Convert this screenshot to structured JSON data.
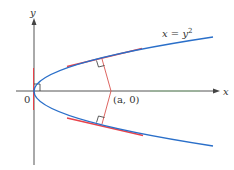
{
  "diagram": {
    "type": "parabola-normal-lines",
    "axes": {
      "x_label": "x",
      "y_label": "y",
      "origin_label": "0"
    },
    "curve": {
      "label_lhs": "x = y",
      "label_exponent": "2",
      "color": "#2a6fc9"
    },
    "point": {
      "label": "(a, 0)"
    },
    "colors": {
      "axis": "#555555",
      "tangent": "#e8424a",
      "normal": "#d9534f",
      "right_angle": "#333333",
      "axis_highlight": "#7fc97f"
    }
  }
}
